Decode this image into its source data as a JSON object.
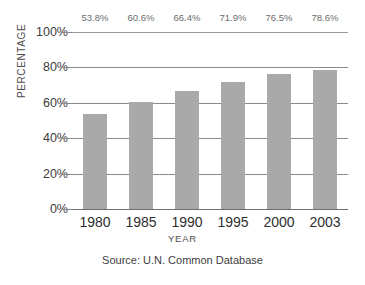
{
  "chart_data": {
    "type": "bar",
    "title": "",
    "subtitle": "",
    "xlabel": "YEAR",
    "ylabel": "PERCENTAGE",
    "categories": [
      "1980",
      "1985",
      "1990",
      "1995",
      "2000",
      "2003"
    ],
    "values": [
      53.8,
      60.6,
      66.4,
      71.9,
      76.5,
      78.6
    ],
    "data_labels": [
      "53.8%",
      "60.6%",
      "66.4%",
      "71.9%",
      "76.5%",
      "78.6%"
    ],
    "ylim": [
      0,
      100
    ],
    "ytick_labels": [
      "100%",
      "80%",
      "60%",
      "40%",
      "20%",
      "0%"
    ],
    "ytick_values": [
      100,
      80,
      60,
      40,
      20,
      0
    ],
    "grid": true,
    "legend": false,
    "series": [
      {
        "name": "",
        "values": [
          53.8,
          60.6,
          66.4,
          71.9,
          76.5,
          78.6
        ]
      }
    ],
    "annotations": {
      "source": "Source: U.N. Common Database"
    },
    "colors": {
      "bar_fill": "#a9a9a9",
      "gridline": "#8a8a8a",
      "axis_text": "#2e2e2e",
      "data_label_text": "#6b6b6b",
      "background": "#ffffff"
    }
  }
}
